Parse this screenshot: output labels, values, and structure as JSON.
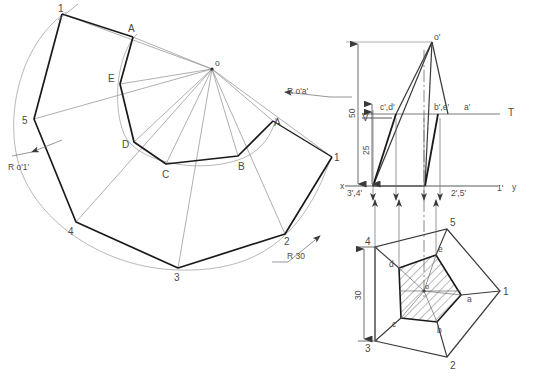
{
  "figure": {
    "line_color": "#4a4a4a",
    "heavy_color": "#1a1a1a",
    "thin_color": "#808080",
    "hatch_color": "#555555",
    "background": "#ffffff"
  },
  "development": {
    "apex_label": "o",
    "outer_points": [
      {
        "label": "1",
        "x": 62,
        "y": 14
      },
      {
        "label": "5",
        "x": 34,
        "y": 119
      },
      {
        "label": "4",
        "x": 76,
        "y": 222
      },
      {
        "label": "3",
        "x": 178,
        "y": 268
      },
      {
        "label": "2",
        "x": 285,
        "y": 234
      }
    ],
    "extra_outer_label": {
      "label": "1",
      "x": 332,
      "y": 157
    },
    "inner_points": [
      {
        "label": "A",
        "x": 133,
        "y": 37
      },
      {
        "label": "E",
        "x": 120,
        "y": 84
      },
      {
        "label": "D",
        "x": 134,
        "y": 142
      },
      {
        "label": "C",
        "x": 166,
        "y": 164
      },
      {
        "label": "B",
        "x": 238,
        "y": 156
      },
      {
        "label": "A",
        "x": 273,
        "y": 121
      }
    ],
    "radius_label_outer": "R o'1'",
    "radius_label_inner": "R o'a'",
    "radius_label_arc": "R 30"
  },
  "elevation": {
    "apex_label": "o'",
    "plane_label_v": "V",
    "plane_label_t": "T",
    "axis_label_x": "x",
    "axis_label_y": "y",
    "dimension_50": "50",
    "dimension_25": "25",
    "base_left_label": "3',4'",
    "base_right_label": "2',5'",
    "base_far_right_label": "1'",
    "cut_left_label": "c',d'",
    "cut_mid_label": "b',e'",
    "cut_right_label": "a'"
  },
  "plan": {
    "dimension_30": "30",
    "center_label": "o",
    "outer_labels": [
      {
        "label": "3",
        "x": 368,
        "y": 341
      },
      {
        "label": "4",
        "x": 368,
        "y": 247
      },
      {
        "label": "5",
        "x": 452,
        "y": 222
      },
      {
        "label": "2",
        "x": 452,
        "y": 362
      },
      {
        "label": "1",
        "x": 505,
        "y": 291
      }
    ],
    "inner_labels": [
      {
        "label": "a",
        "x": 466,
        "y": 296
      },
      {
        "label": "b",
        "x": 441,
        "y": 325
      },
      {
        "label": "c",
        "x": 396,
        "y": 320
      },
      {
        "label": "d",
        "x": 395,
        "y": 268
      },
      {
        "label": "e",
        "x": 440,
        "y": 254
      }
    ]
  }
}
